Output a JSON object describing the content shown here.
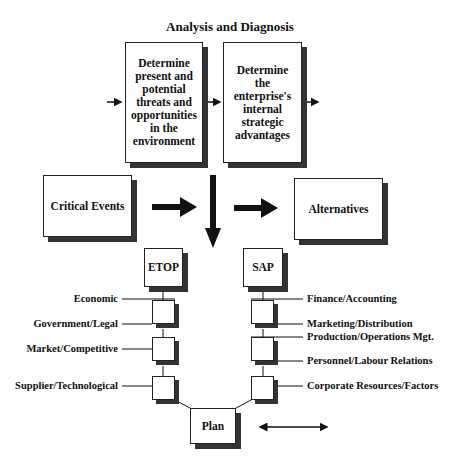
{
  "title": "Analysis and Diagnosis",
  "analysis_boxes": [
    {
      "id": "environment",
      "text": "Determine present and potential threats and opportunities in the environment"
    },
    {
      "id": "internal",
      "text": "Determine the enterprise's internal strategic advantages"
    }
  ],
  "critical_events": "Critical Events",
  "alternatives": "Alternatives",
  "etop": {
    "label": "ETOP",
    "factors": [
      "Economic",
      "Government/Legal",
      "Market/Competitive",
      "Supplier/Technological"
    ]
  },
  "sap": {
    "label": "SAP",
    "factors": [
      "Finance/Accounting",
      "Marketing/Distribution",
      "Production/Operations Mgt.",
      "Personnel/Labour Relations",
      "Corporate Resources/Factors"
    ]
  },
  "plan": "Plan",
  "colors": {
    "line": "#111111",
    "shadow": "#333333",
    "background": "#ffffff"
  }
}
